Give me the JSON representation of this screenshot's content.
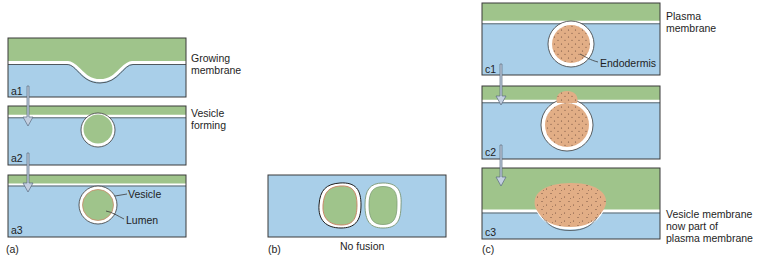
{
  "colors": {
    "cytoplasm_blue": "#a9cfe9",
    "green": "#9fc48b",
    "membrane_white": "#ffffff",
    "outline": "#3a3a3a",
    "endodermis_tan": "#e2ae86",
    "arrow_fill": "#c3cfe0",
    "lumen_edge": "#c98a6a"
  },
  "panel_a": {
    "caption": "(a)",
    "steps": [
      {
        "id": "a1",
        "label": "a1",
        "annotation": [
          "Growing",
          "membrane"
        ]
      },
      {
        "id": "a2",
        "label": "a2",
        "annotation": [
          "Vesicle",
          "forming"
        ]
      },
      {
        "id": "a3",
        "label": "a3",
        "callouts": [
          "Vesicle",
          "Lumen"
        ]
      }
    ]
  },
  "panel_b": {
    "caption": "(b)",
    "subtitle": "No fusion"
  },
  "panel_c": {
    "caption": "(c)",
    "steps": [
      {
        "id": "c1",
        "label": "c1",
        "annotation": [
          "Plasma",
          "membrane"
        ],
        "callout": "Endodermis"
      },
      {
        "id": "c2",
        "label": "c2"
      },
      {
        "id": "c3",
        "label": "c3",
        "annotation": [
          "Vesicle membrane",
          "now part of",
          "plasma membrane"
        ]
      }
    ]
  }
}
